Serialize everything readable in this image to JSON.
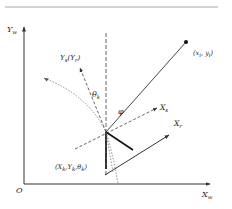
{
  "diagram": {
    "type": "coordinate-frame",
    "colors": {
      "line": "#333333",
      "dashed": "#555555",
      "dotted": "#777777",
      "rule": "#aaaaaa",
      "background": "#ffffff"
    },
    "labels": {
      "world_y_axis": {
        "base": "Y",
        "sub": "w"
      },
      "world_x_axis": {
        "base": "X",
        "sub": "w"
      },
      "origin": "O",
      "sensor_y_axis": {
        "base": "Y",
        "sub": "s",
        "paren_base": "Y",
        "paren_sub": "r"
      },
      "sensor_x_axis": {
        "base": "X",
        "sub": "s"
      },
      "robot_x_axis": {
        "base": "X",
        "sub": "r"
      },
      "heading_angle": {
        "base": "θ",
        "sub": "k"
      },
      "bearing_angle": "φ",
      "target_point": {
        "open": "(",
        "x": "x",
        "xsub": "i",
        "sep": ", ",
        "y": "y",
        "ysub": "i",
        "close": ")"
      },
      "robot_pose": {
        "open": "(",
        "a": "X",
        "asub": "k",
        "b": "Y",
        "bsub": "k",
        "c": "θ",
        "csub": "k",
        "close": ")"
      }
    }
  }
}
